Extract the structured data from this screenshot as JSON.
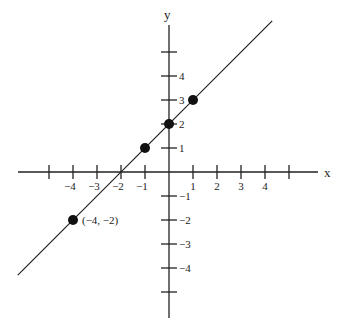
{
  "chart_data": {
    "type": "line",
    "title": "",
    "xlabel": "x",
    "ylabel": "y",
    "xlim": [
      -6.3,
      6.3
    ],
    "ylim": [
      -6.1,
      6.1
    ],
    "grid": false,
    "x_ticks": [
      -5,
      -4,
      -3,
      -2,
      -1,
      1,
      2,
      3,
      4,
      5
    ],
    "x_tick_labels": [
      "",
      "−4",
      "−3",
      "−2",
      "−1",
      "1",
      "2",
      "3",
      "4",
      ""
    ],
    "y_ticks": [
      -5,
      -4,
      -3,
      -2,
      -1,
      1,
      2,
      3,
      4,
      5
    ],
    "y_tick_labels": [
      "",
      "−4",
      "−3",
      "−2",
      "−1",
      "1",
      "2",
      "3",
      "4",
      ""
    ],
    "series": [
      {
        "name": "y = x + 2",
        "x": [
          -6.3,
          4.3
        ],
        "y": [
          -4.3,
          6.3
        ],
        "color": "#222222"
      }
    ],
    "points": [
      {
        "x": -4,
        "y": -2,
        "label": "(−4, −2)"
      },
      {
        "x": -1,
        "y": 1,
        "label": ""
      },
      {
        "x": 0,
        "y": 2,
        "label": ""
      },
      {
        "x": 1,
        "y": 3,
        "label": ""
      }
    ]
  }
}
